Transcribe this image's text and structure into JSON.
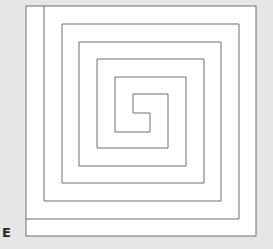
{
  "figure": {
    "panel_label": "E",
    "colors": {
      "background": "#e6e6e6",
      "panel": "#ffffff",
      "line": "#6e6e6e"
    },
    "outer_box": [
      26,
      6,
      230,
      230
    ],
    "arms": [
      "26,219 239,219 239,24 62,24 62,183 204,183 204,59 97,59 97,148 168,148 168,94 133,94 133,113 150,113",
      "44,6 44,201 221,201 221,42 79,42 79,166 186,166 186,77 115,77 115,132 150,132 150,113"
    ]
  }
}
